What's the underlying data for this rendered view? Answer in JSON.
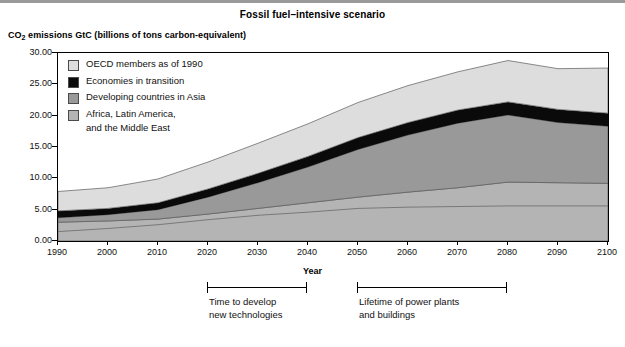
{
  "chart_data": {
    "type": "area",
    "stacked": true,
    "title": "Fossil fuel–intensive scenario",
    "ylabel": "CO2 emissions GtC (billions of tons carbon-equivalent)",
    "xlabel": "Year",
    "ylim": [
      0,
      30
    ],
    "xlim": [
      1990,
      2100
    ],
    "grid": false,
    "legend_position": "inside-top-left",
    "x": [
      1990,
      2000,
      2010,
      2020,
      2030,
      2040,
      2050,
      2060,
      2070,
      2080,
      2090,
      2100
    ],
    "ytick_labels": [
      "0.00",
      "5.00",
      "10.00",
      "15.00",
      "20.00",
      "25.00",
      "30.00"
    ],
    "ytick_values": [
      0,
      5,
      10,
      15,
      20,
      25,
      30
    ],
    "xtick_labels": [
      "1990",
      "2000",
      "2010",
      "2020",
      "2030",
      "2040",
      "2050",
      "2060",
      "2070",
      "2080",
      "2090",
      "2100"
    ],
    "series": [
      {
        "name": "Africa, Latin America,\nand the Middle East",
        "key": "africa",
        "color": "#b4b4b4",
        "values": [
          3.0,
          3.2,
          3.5,
          4.3,
          5.2,
          6.1,
          7.0,
          7.8,
          8.5,
          9.4,
          9.3,
          9.2
        ]
      },
      {
        "name": "Developing countries in Asia",
        "key": "asia",
        "color": "#999999",
        "values": [
          0.7,
          1.0,
          1.5,
          2.7,
          4.1,
          5.7,
          7.6,
          9.1,
          10.3,
          10.7,
          9.6,
          9.1
        ]
      },
      {
        "name": "Economies in transition",
        "key": "transition",
        "color": "#0a0a0a",
        "values": [
          1.1,
          1.0,
          1.1,
          1.3,
          1.5,
          1.7,
          1.9,
          2.0,
          2.1,
          2.1,
          2.1,
          2.1
        ]
      },
      {
        "name": "OECD members as of 1990",
        "key": "oecd",
        "color": "#dddddd",
        "values": [
          3.1,
          3.3,
          3.8,
          4.3,
          4.8,
          5.2,
          5.6,
          5.9,
          6.1,
          6.6,
          6.5,
          7.2
        ]
      }
    ],
    "interior_line": {
      "note": "boundary inside the Africa/Latin America band",
      "values": [
        1.5,
        2.0,
        2.6,
        3.4,
        4.1,
        4.6,
        5.2,
        5.4,
        5.5,
        5.6,
        5.6,
        5.6
      ]
    },
    "totals": [
      7.9,
      8.5,
      9.9,
      12.6,
      15.6,
      18.7,
      22.1,
      24.8,
      27.0,
      28.8,
      27.5,
      27.6
    ]
  },
  "legend": {
    "items": [
      {
        "label": "OECD members as of 1990",
        "color": "#dddddd"
      },
      {
        "label": "Economies in transition",
        "color": "#0a0a0a"
      },
      {
        "label": "Developing countries in Asia",
        "color": "#999999"
      },
      {
        "label": "Africa, Latin America,\nand the Middle East",
        "color": "#b4b4b4"
      }
    ]
  },
  "annotations": [
    {
      "label": "Time to develop\nnew technologies",
      "start_year": 2020,
      "end_year": 2040
    },
    {
      "label": "Lifetime of power plants\nand buildings",
      "start_year": 2050,
      "end_year": 2080
    }
  ]
}
